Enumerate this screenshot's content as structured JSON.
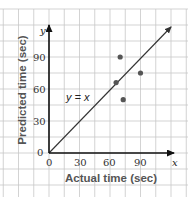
{
  "chart_data": {
    "type": "scatter",
    "title": "",
    "xlabel": "Actual time (sec)",
    "ylabel": "Predicted time (sec)",
    "x_axis_var": "x",
    "y_axis_var": "y",
    "xlim": [
      0,
      120
    ],
    "ylim": [
      0,
      120
    ],
    "x_ticks": [
      0,
      30,
      60,
      90
    ],
    "y_ticks": [
      0,
      30,
      60,
      90
    ],
    "grid": true,
    "grid_step": 15,
    "series": [
      {
        "name": "data points",
        "points": [
          {
            "x": 70,
            "y": 90
          },
          {
            "x": 90,
            "y": 75
          },
          {
            "x": 66,
            "y": 66
          },
          {
            "x": 73,
            "y": 50
          }
        ]
      }
    ],
    "reference_line": {
      "label": "y = x",
      "from": [
        0,
        0
      ],
      "to": [
        120,
        120
      ]
    },
    "legend": null
  },
  "labels": {
    "x_title": "Actual time (sec)",
    "y_title": "Predicted time (sec)",
    "x_var": "x",
    "y_var": "y",
    "line_label": "y = x",
    "origin_y": "0",
    "x_ticks": [
      "0",
      "30",
      "60",
      "90"
    ],
    "y_ticks": [
      "30",
      "60",
      "90"
    ]
  }
}
